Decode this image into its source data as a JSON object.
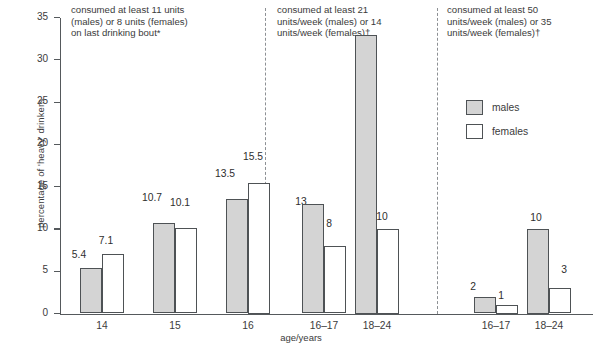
{
  "chart_data": {
    "type": "bar",
    "title": "",
    "xlabel": "age/years",
    "ylabel": "percentage of 'heavy' drinkers",
    "ylim": [
      0,
      37
    ],
    "yticks": [
      0,
      5,
      10,
      15,
      20,
      25,
      30,
      35
    ],
    "grid": false,
    "legend_position": "upper-right",
    "legend": [
      "males",
      "females"
    ],
    "series": [
      {
        "name": "males",
        "color": "#d4d4d4"
      },
      {
        "name": "females",
        "color": "#ffffff"
      }
    ],
    "panels": [
      {
        "caption": "consumed at least 11 units\n(males) or 8 units (females)\non last drinking bout*",
        "categories": [
          "14",
          "15",
          "16"
        ],
        "males": [
          5.4,
          10.7,
          13.5
        ],
        "females": [
          7.1,
          10.1,
          15.5
        ],
        "male_labels": [
          "5.4",
          "10.7",
          "13.5"
        ],
        "female_labels": [
          "7.1",
          "10.1",
          "15.5"
        ]
      },
      {
        "caption": "consumed at least 21\nunits/week (males) or 14\nunits/week (females)†",
        "categories": [
          "16–17",
          "18–24"
        ],
        "males": [
          13,
          33
        ],
        "females": [
          8,
          10
        ],
        "male_labels": [
          "13",
          "33"
        ],
        "female_labels": [
          "8",
          "10"
        ]
      },
      {
        "caption": "consumed at least 50\nunits/week (males) or 35\nunits/week (females)†",
        "categories": [
          "16–17",
          "18–24"
        ],
        "males": [
          2,
          10
        ],
        "females": [
          1,
          3
        ],
        "male_labels": [
          "2",
          "10"
        ],
        "female_labels": [
          "1",
          "3"
        ]
      }
    ]
  },
  "axis": {
    "ylabel": "percentage of 'heavy' drinkers",
    "xlabel": "age/years",
    "yticks": [
      "0",
      "5",
      "10",
      "15",
      "20",
      "25",
      "30",
      "35"
    ]
  },
  "captions": {
    "panel1": "consumed at least 11 units\n(males) or 8 units (females)\non last drinking bout*",
    "panel2": "consumed at least 21\nunits/week (males) or 14\nunits/week (females)†",
    "panel3": "consumed at least 50\nunits/week (males) or 35\nunits/week (females)†"
  },
  "legend": {
    "males": "males",
    "females": "females"
  },
  "groups": {
    "p1g1": "14",
    "p1g2": "15",
    "p1g3": "16",
    "p2g1": "16–17",
    "p2g2": "18–24",
    "p3g1": "16–17",
    "p3g2": "18–24"
  },
  "values": {
    "p1g1m": "5.4",
    "p1g1f": "7.1",
    "p1g2m": "10.7",
    "p1g2f": "10.1",
    "p1g3m": "13.5",
    "p1g3f": "15.5",
    "p2g1m": "13",
    "p2g1f": "8",
    "p2g2m": "33",
    "p2g2f": "10",
    "p3g1m": "2",
    "p3g1f": "1",
    "p3g2m": "10",
    "p3g2f": "3"
  },
  "colors": {
    "males_fill": "#d4d4d4",
    "females_fill": "#ffffff",
    "bar_stroke": "#4e5255",
    "axis": "#55595c",
    "text": "#3b3b3b"
  }
}
